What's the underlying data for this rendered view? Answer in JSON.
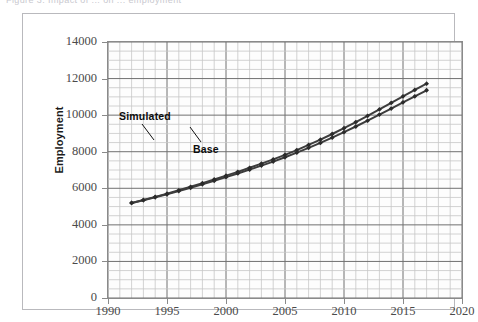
{
  "figure": {
    "caption_partial": "Figure 3.  Impact of ... on ... employment",
    "frame_color": "#b9b9bd"
  },
  "axes": {
    "y_title": "Employment",
    "y_ticks": [
      "0",
      "2000",
      "4000",
      "6000",
      "8000",
      "10000",
      "12000",
      "14000"
    ],
    "x_ticks": [
      "1990",
      "1995",
      "2000",
      "2005",
      "2010",
      "2015",
      "2020"
    ]
  },
  "annotations": {
    "simulated": "Simulated",
    "base": "Base"
  },
  "chart_data": {
    "type": "line",
    "title": "",
    "xlabel": "",
    "ylabel": "Employment",
    "xlim": [
      1990,
      2020
    ],
    "ylim": [
      0,
      14000
    ],
    "ytick_step": 2000,
    "xtick_step": 5,
    "grid": true,
    "grid_minor_x_step": 1,
    "grid_minor_y_step": 500,
    "legend": "none (inline annotations)",
    "marker": "diamond",
    "line_color": "#3d3d3d",
    "x": [
      1992,
      1993,
      1994,
      1995,
      1996,
      1997,
      1998,
      1999,
      2000,
      2001,
      2002,
      2003,
      2004,
      2005,
      2006,
      2007,
      2008,
      2009,
      2010,
      2011,
      2012,
      2013,
      2014,
      2015,
      2016,
      2017
    ],
    "series": [
      {
        "name": "Simulated",
        "values": [
          5200,
          5360,
          5530,
          5700,
          5890,
          6080,
          6280,
          6480,
          6690,
          6900,
          7120,
          7350,
          7580,
          7830,
          8090,
          8370,
          8660,
          8970,
          9290,
          9620,
          9960,
          10310,
          10670,
          11030,
          11380,
          11720
        ]
      },
      {
        "name": "Base",
        "values": [
          5200,
          5350,
          5510,
          5670,
          5850,
          6030,
          6220,
          6410,
          6610,
          6810,
          7020,
          7240,
          7460,
          7700,
          7950,
          8210,
          8480,
          8770,
          9070,
          9380,
          9700,
          10030,
          10360,
          10700,
          11030,
          11360
        ]
      }
    ]
  }
}
